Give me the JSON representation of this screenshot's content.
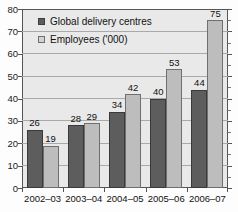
{
  "chart_data": {
    "type": "bar",
    "title": "",
    "subtitle": "",
    "xlabel": "",
    "ylabel": "",
    "categories": [
      "2002–03",
      "2003–04",
      "2004–05",
      "2005–06",
      "2006–07"
    ],
    "series": [
      {
        "name": "Global delivery centres",
        "values": [
          26,
          28,
          34,
          40,
          44
        ],
        "color": "#5d5d5d"
      },
      {
        "name": "Employees ('000)",
        "values": [
          19,
          29,
          42,
          53,
          75
        ],
        "color": "#bdbdbd"
      }
    ],
    "ylim": [
      0,
      80
    ],
    "yticks": [
      0,
      10,
      20,
      30,
      40,
      50,
      60,
      70,
      80
    ],
    "ytick_labels": [
      "0",
      "10",
      "20",
      "30",
      "40",
      "50",
      "60",
      "70",
      "80"
    ],
    "grid": true,
    "grid_axis": "y",
    "legend_position": "top-left",
    "data_labels": true,
    "plot_background": "#e9e9e9",
    "axis_color": "#555555",
    "gridline_color": "#a9a9a9"
  }
}
